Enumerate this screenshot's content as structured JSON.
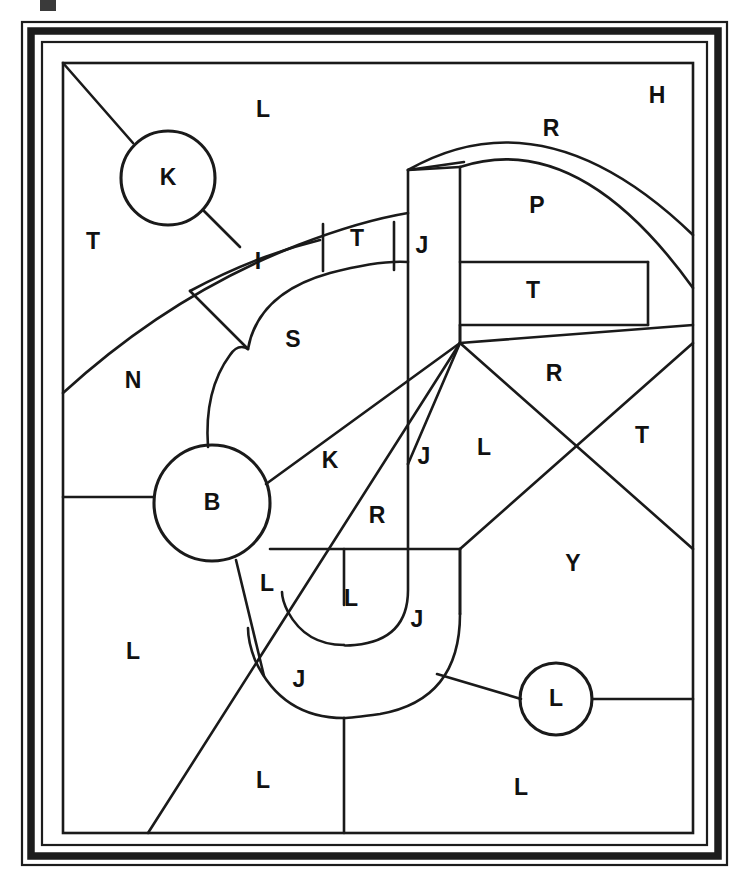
{
  "document": {
    "title": "Tessellation Puzzle Worksheet",
    "description": "Black-and-white line-drawing puzzle: a framed rectangular panel subdivided into irregular regions, each marked with a single capital letter. Circular nodes joined by line segments overlay the partition.",
    "background_color": "#ffffff",
    "ink_color": "#1a1a1a"
  },
  "frame": {
    "name": "decorative-triple-border",
    "layers": [
      {
        "kind": "thin-line",
        "inset": 22,
        "stroke": "#1c1c1c",
        "width": 2.2
      },
      {
        "kind": "thick-band",
        "inset": 29,
        "stroke": "#1c1c1c",
        "width": 7.5
      },
      {
        "kind": "thin-line",
        "inset": 40,
        "stroke": "#1c1c1c",
        "width": 2.2
      }
    ],
    "panel": {
      "x": 63,
      "y": 63,
      "width": 630,
      "height": 770
    }
  },
  "artifacts": {
    "top_smudge": {
      "name": "scan-smudge",
      "x": 40,
      "y": 0,
      "width": 16,
      "height": 11
    }
  },
  "nodes": [
    {
      "id": "node-k",
      "label": "K",
      "cx": 168,
      "cy": 178,
      "r": 47
    },
    {
      "id": "node-b",
      "label": "B",
      "cx": 212,
      "cy": 503,
      "r": 58
    },
    {
      "id": "node-l",
      "label": "L",
      "cx": 556,
      "cy": 699,
      "r": 36
    }
  ],
  "region_labels": [
    {
      "id": "label-L-top",
      "letter": "L",
      "x": 263,
      "y": 111
    },
    {
      "id": "label-H",
      "letter": "H",
      "x": 657,
      "y": 97
    },
    {
      "id": "label-R-arch",
      "letter": "R",
      "x": 551,
      "y": 130
    },
    {
      "id": "label-P",
      "letter": "P",
      "x": 537,
      "y": 207
    },
    {
      "id": "label-T-left",
      "letter": "T",
      "x": 93,
      "y": 243
    },
    {
      "id": "label-I",
      "letter": "I",
      "x": 258,
      "y": 263
    },
    {
      "id": "label-T-band",
      "letter": "T",
      "x": 357,
      "y": 240
    },
    {
      "id": "label-J-bar",
      "letter": "J",
      "x": 422,
      "y": 247
    },
    {
      "id": "label-T-box",
      "letter": "T",
      "x": 533,
      "y": 292
    },
    {
      "id": "label-S",
      "letter": "S",
      "x": 293,
      "y": 341
    },
    {
      "id": "label-R-right",
      "letter": "R",
      "x": 554,
      "y": 375
    },
    {
      "id": "label-N",
      "letter": "N",
      "x": 133,
      "y": 382
    },
    {
      "id": "label-K-cell",
      "letter": "K",
      "x": 330,
      "y": 462
    },
    {
      "id": "label-J-mid",
      "letter": "J",
      "x": 424,
      "y": 458
    },
    {
      "id": "label-L-mid",
      "letter": "L",
      "x": 484,
      "y": 449
    },
    {
      "id": "label-T-right",
      "letter": "T",
      "x": 642,
      "y": 437
    },
    {
      "id": "label-R-mid",
      "letter": "R",
      "x": 377,
      "y": 517
    },
    {
      "id": "label-L-underB",
      "letter": "L",
      "x": 267,
      "y": 585
    },
    {
      "id": "label-L-hook",
      "letter": "L",
      "x": 351,
      "y": 600
    },
    {
      "id": "label-J-inner",
      "letter": "J",
      "x": 417,
      "y": 621
    },
    {
      "id": "label-Y",
      "letter": "Y",
      "x": 573,
      "y": 565
    },
    {
      "id": "label-L-left-big",
      "letter": "L",
      "x": 133,
      "y": 653
    },
    {
      "id": "label-J-outer",
      "letter": "J",
      "x": 299,
      "y": 681
    },
    {
      "id": "label-L-bottom-mid",
      "letter": "L",
      "x": 263,
      "y": 782
    },
    {
      "id": "label-L-bottom-rgt",
      "letter": "L",
      "x": 521,
      "y": 789
    }
  ],
  "edges": {
    "straight": [
      {
        "id": "edge-diag-topleft",
        "x1": 63,
        "y1": 63,
        "x2": 133,
        "y2": 143
      },
      {
        "id": "edge-k-to-band",
        "x1": 204,
        "y1": 211,
        "x2": 240,
        "y2": 247
      },
      {
        "id": "edge-inner-to-s",
        "x1": 190,
        "y1": 291,
        "x2": 248,
        "y2": 349
      },
      {
        "id": "edge-band-split-1",
        "x1": 323,
        "y1": 224,
        "x2": 323,
        "y2": 271
      },
      {
        "id": "edge-band-split-2",
        "x1": 394,
        "y1": 222,
        "x2": 394,
        "y2": 270
      },
      {
        "id": "edge-jbar-left",
        "x1": 408,
        "y1": 170,
        "x2": 408,
        "y2": 464
      },
      {
        "id": "edge-jbar-right",
        "x1": 460,
        "y1": 167,
        "x2": 460,
        "y2": 343
      },
      {
        "id": "edge-jbar-top",
        "x1": 408,
        "y1": 170,
        "x2": 460,
        "y2": 167
      },
      {
        "id": "edge-arch-base-left",
        "x1": 408,
        "y1": 170,
        "x2": 464,
        "y2": 162
      },
      {
        "id": "edge-tbox-top",
        "x1": 460,
        "y1": 262,
        "x2": 648,
        "y2": 262
      },
      {
        "id": "edge-tbox-bottom",
        "x1": 460,
        "y1": 325,
        "x2": 648,
        "y2": 325
      },
      {
        "id": "edge-tbox-right",
        "x1": 648,
        "y1": 262,
        "x2": 648,
        "y2": 325
      },
      {
        "id": "edge-hub-to-tboxcorner",
        "x1": 460,
        "y1": 343,
        "x2": 460,
        "y2": 325
      },
      {
        "id": "edge-hub-up-right",
        "x1": 460,
        "y1": 343,
        "x2": 693,
        "y2": 325
      },
      {
        "id": "edge-hub-x-down",
        "x1": 460,
        "y1": 343,
        "x2": 693,
        "y2": 549
      },
      {
        "id": "edge-x-upright",
        "x1": 693,
        "y1": 343,
        "x2": 460,
        "y2": 549
      },
      {
        "id": "edge-hub-to-b",
        "x1": 460,
        "y1": 343,
        "x2": 266,
        "y2": 484
      },
      {
        "id": "edge-hub-to-jhook",
        "x1": 460,
        "y1": 343,
        "x2": 408,
        "y2": 464
      },
      {
        "id": "edge-hub-long-diag",
        "x1": 460,
        "y1": 343,
        "x2": 148,
        "y2": 833
      },
      {
        "id": "edge-left-tick-b",
        "x1": 63,
        "y1": 497,
        "x2": 154,
        "y2": 497
      },
      {
        "id": "edge-midband-left",
        "x1": 270,
        "y1": 549,
        "x2": 460,
        "y2": 549
      },
      {
        "id": "edge-jcol-mid",
        "x1": 408,
        "y1": 464,
        "x2": 408,
        "y2": 549
      },
      {
        "id": "edge-b-down",
        "x1": 236,
        "y1": 560,
        "x2": 264,
        "y2": 676
      },
      {
        "id": "edge-jstem-left",
        "x1": 344,
        "y1": 549,
        "x2": 344,
        "y2": 605
      },
      {
        "id": "edge-jstem-down",
        "x1": 344,
        "y1": 718,
        "x2": 344,
        "y2": 833
      },
      {
        "id": "edge-jhook-right-down",
        "x1": 460,
        "y1": 549,
        "x2": 460,
        "y2": 614
      },
      {
        "id": "edge-lnode-left",
        "x1": 437,
        "y1": 674,
        "x2": 521,
        "y2": 699
      },
      {
        "id": "edge-lnode-right",
        "x1": 592,
        "y1": 699,
        "x2": 693,
        "y2": 699
      },
      {
        "id": "edge-y-lower-left",
        "x1": 460,
        "y1": 549,
        "x2": 460,
        "y2": 614
      }
    ],
    "curved": [
      {
        "id": "edge-arc-outer-left",
        "d": "M 63 393 Q 170 295 298 245 Q 360 221 408 213"
      },
      {
        "id": "edge-arc-inner-left",
        "d": "M 190 291 Q 255 256 320 240"
      },
      {
        "id": "edge-arc-s-outer",
        "d": "M 248 349 Q 258 293 330 273 Q 380 260 408 262"
      },
      {
        "id": "edge-arc-s-left",
        "d": "M 208 447 Q 204 390 230 355 Q 238 343 248 349"
      },
      {
        "id": "edge-arch-outer",
        "d": "M 408 170 Q 545 92 693 235"
      },
      {
        "id": "edge-arch-inner",
        "d": "M 460 167 Q 578 128 693 288"
      },
      {
        "id": "edge-j-hook-inner",
        "d": "M 408 549 L 408 590 Q 408 640 355 645 Q 344 646 344 645"
      },
      {
        "id": "edge-j-hook-outer",
        "d": "M 460 614 Q 460 700 380 714 Q 350 718 344 718"
      },
      {
        "id": "edge-j-hook-outer-l",
        "d": "M 344 718 Q 282 718 255 660 Q 248 642 248 628"
      },
      {
        "id": "edge-j-hook-inner-l",
        "d": "M 344 645 Q 306 645 288 612 Q 282 600 282 592"
      }
    ]
  }
}
